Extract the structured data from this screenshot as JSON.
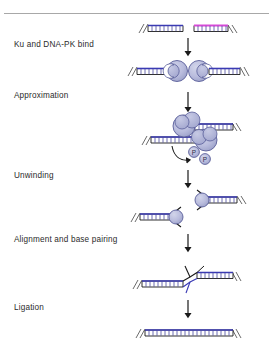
{
  "figure": {
    "background_color": "#ffffff",
    "top_rule_color": "#a8a8a8"
  },
  "colors": {
    "dna_backbone_blue": "#3a3ab4",
    "dna_backbone_magenta": "#d84ad8",
    "dna_rung": "#4a4a9e",
    "dna_outline": "#1a1a1a",
    "protein_fill": "#b9bcdd",
    "protein_stroke": "#5a5f9a",
    "protein_fill_dark": "#a3a7cf",
    "arrow_color": "#1a1a1a",
    "label_text": "#2b2b2b"
  },
  "stages": [
    {
      "id": "ku-binding",
      "label": "Ku and DNA-PK bind",
      "description": "Two broken DNA duplex ends; Ku heterodimer rings load onto each end"
    },
    {
      "id": "approximation",
      "label": "Approximation",
      "description": "DNA-PK complexes bring the two DNA ends together; autophosphorylation releases phosphate groups"
    },
    {
      "id": "unwinding",
      "label": "Unwinding",
      "description": "DNA ends are unwound producing splayed single-stranded overhangs"
    },
    {
      "id": "alignment",
      "label": "Alignment and base pairing",
      "description": "Single-stranded ends anneal through microhomology base pairing"
    },
    {
      "id": "ligation",
      "label": "Ligation",
      "description": "Ligase IV seals the nicks producing a continuous repaired DNA duplex"
    }
  ],
  "annotations": {
    "phosphate_1": "P",
    "phosphate_2": "P"
  },
  "elements": {
    "dna_end_left_broken": "DNA duplex left fragment with blue backbone",
    "dna_end_right_broken": "DNA duplex right fragment with magenta backbone",
    "ku_ring_left": "Ku protein ring on left DNA end",
    "ku_ring_right": "Ku protein ring on right DNA end",
    "repaired_duplex": "Continuous repaired DNA duplex"
  }
}
